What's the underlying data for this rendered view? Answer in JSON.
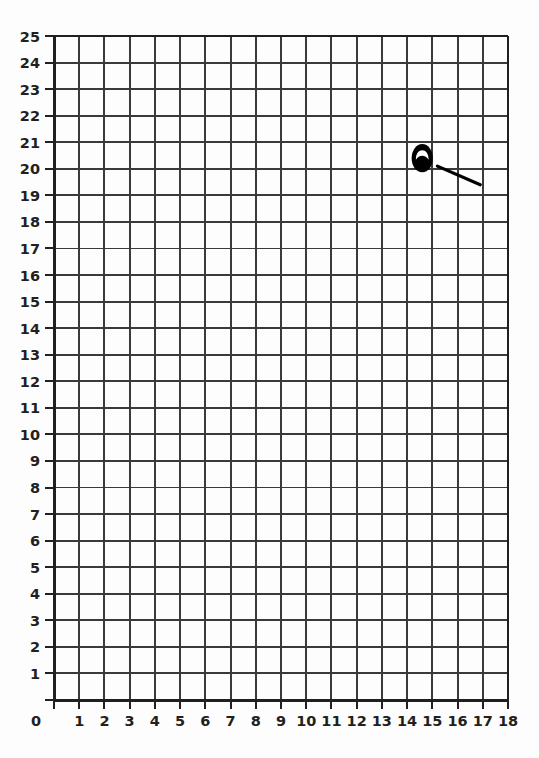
{
  "figure": {
    "title": "",
    "background_color": "#fdfdfd",
    "grid_line_color": "#3a3a3a",
    "axis_line_color": "#231f20",
    "label_color": "#231f20",
    "mark_color": "#000000"
  },
  "chart_data": {
    "type": "scatter",
    "title": "",
    "xlabel": "",
    "ylabel": "",
    "xlim": [
      0,
      18
    ],
    "ylim": [
      0,
      25
    ],
    "grid": true,
    "legend": null,
    "x_ticks": [
      0,
      1,
      2,
      3,
      4,
      5,
      6,
      7,
      8,
      9,
      10,
      11,
      12,
      13,
      14,
      15,
      16,
      17,
      18
    ],
    "y_ticks": [
      0,
      1,
      2,
      3,
      4,
      5,
      6,
      7,
      8,
      9,
      10,
      11,
      12,
      13,
      14,
      15,
      16,
      17,
      18,
      19,
      20,
      21,
      22,
      23,
      24,
      25
    ],
    "x_tick_labels": [
      "0",
      "1",
      "2",
      "3",
      "4",
      "5",
      "6",
      "7",
      "8",
      "9",
      "10",
      "11",
      "12",
      "13",
      "14",
      "15",
      "16",
      "17",
      "18"
    ],
    "y_tick_labels": [
      "1",
      "2",
      "3",
      "4",
      "5",
      "6",
      "7",
      "8",
      "9",
      "10",
      "11",
      "12",
      "13",
      "14",
      "15",
      "16",
      "17",
      "18",
      "19",
      "20",
      "21",
      "22",
      "23",
      "24",
      "25"
    ],
    "origin_label": "0",
    "annotations": [
      {
        "name": "ellipse-mark",
        "shape": "ellipse",
        "center": [
          14.6,
          20.4
        ],
        "radius_x": 0.42,
        "radius_y": 0.53,
        "style": "thick-outline-filled-bottom",
        "color": "#000000"
      },
      {
        "name": "line-mark",
        "shape": "line",
        "start": [
          15.2,
          20.1
        ],
        "end": [
          16.9,
          19.4
        ],
        "color": "#000000",
        "width": 3.2
      }
    ]
  }
}
